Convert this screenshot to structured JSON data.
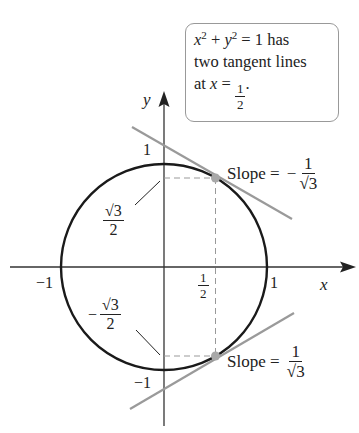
{
  "note": {
    "equation": {
      "x": "x",
      "exp1": "2",
      "plus": " + ",
      "y": "y",
      "exp2": "2",
      "rest": " = 1 has"
    },
    "line2": "two tangent lines",
    "line3_prefix": "at ",
    "line3_var": "x",
    "line3_eq": " = ",
    "line3_num": "1",
    "line3_den": "2",
    "line3_suffix": "."
  },
  "axes": {
    "x_label": "x",
    "y_label": "y",
    "ticks": {
      "y_top": "1",
      "y_bottom": "−1",
      "x_left": "−1",
      "x_right": "1",
      "x_half_num": "1",
      "x_half_den": "2"
    }
  },
  "annotations": {
    "sqrt3_over_2": {
      "num": "√3",
      "den": "2"
    },
    "neg_sqrt3_over_2": {
      "sign": "−",
      "num": "√3",
      "den": "2"
    },
    "slope_upper": {
      "prefix": "Slope = ",
      "sign": "−",
      "num": "1",
      "den": "√3"
    },
    "slope_lower": {
      "prefix": "Slope = ",
      "num": "1",
      "den": "√3"
    }
  },
  "colors": {
    "curve": "#1a1a1a",
    "axis": "#333333",
    "tangent": "#9a9a9a",
    "point": "#a8a8a8",
    "dashed": "#999999"
  }
}
